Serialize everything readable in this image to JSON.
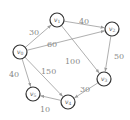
{
  "graph": {
    "type": "directed-weighted",
    "nodes": [
      {
        "id": "v0",
        "base": "v",
        "sub": "0",
        "x": 20,
        "y": 52
      },
      {
        "id": "v1",
        "base": "v",
        "sub": "1",
        "x": 57,
        "y": 20
      },
      {
        "id": "v2",
        "base": "v",
        "sub": "2",
        "x": 112,
        "y": 29
      },
      {
        "id": "v3",
        "base": "v",
        "sub": "3",
        "x": 104,
        "y": 79
      },
      {
        "id": "v4",
        "base": "v",
        "sub": "4",
        "x": 68,
        "y": 102
      },
      {
        "id": "v5",
        "base": "v",
        "sub": "5",
        "x": 33,
        "y": 94
      }
    ],
    "edges": [
      {
        "from": "v0",
        "to": "v1",
        "weight": "30",
        "lx": 29,
        "ly": 35
      },
      {
        "from": "v0",
        "to": "v2",
        "weight": "60",
        "lx": 47,
        "ly": 47
      },
      {
        "from": "v0",
        "to": "v5",
        "weight": "40",
        "lx": 9,
        "ly": 77
      },
      {
        "from": "v0",
        "to": "v4",
        "weight": "150",
        "lx": 41,
        "ly": 74
      },
      {
        "from": "v1",
        "to": "v2",
        "weight": "40",
        "lx": 79,
        "ly": 24
      },
      {
        "from": "v1",
        "to": "v3",
        "weight": "100",
        "lx": 65,
        "ly": 64
      },
      {
        "from": "v2",
        "to": "v3",
        "weight": "50",
        "lx": 114,
        "ly": 59
      },
      {
        "from": "v3",
        "to": "v4",
        "weight": "30",
        "lx": 80,
        "ly": 92
      },
      {
        "from": "v4",
        "to": "v5",
        "weight": "10",
        "lx": 40,
        "ly": 112
      }
    ]
  },
  "colors": {
    "node_stroke": "#333333",
    "edge": "#9a9a9a",
    "label": "#8a8a8a"
  }
}
